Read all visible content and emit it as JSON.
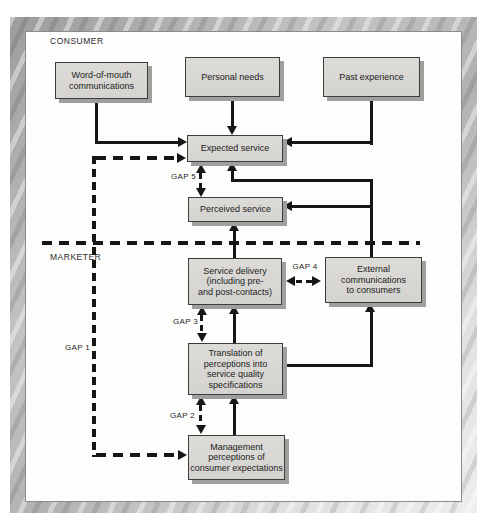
{
  "diagram": {
    "section_labels": {
      "consumer": "CONSUMER",
      "marketer": "MARKETER"
    },
    "boxes": {
      "word_of_mouth": "Word-of-mouth\ncommunications",
      "personal_needs": "Personal needs",
      "past_experience": "Past experience",
      "expected_service": "Expected service",
      "perceived_service": "Perceived service",
      "service_delivery": "Service delivery\n(including pre-\nand post-contacts)",
      "external_communications": "External\ncommunications\nto consumers",
      "translation": "Translation of\nperceptions into\nservice quality\nspecifications",
      "management_perceptions": "Management\nperceptions of\nconsumer expectations"
    },
    "gap_labels": {
      "gap1": "GAP 1",
      "gap2": "GAP 2",
      "gap3": "GAP 3",
      "gap4": "GAP 4",
      "gap5": "GAP 5"
    },
    "colors": {
      "box_fill": "#d7d6d2",
      "box_border": "#3c3c3c",
      "box_shadow": "#9f9f9d",
      "line": "#161616",
      "frame": "#c2c0be",
      "panel_background": "#fdfdfc"
    }
  }
}
